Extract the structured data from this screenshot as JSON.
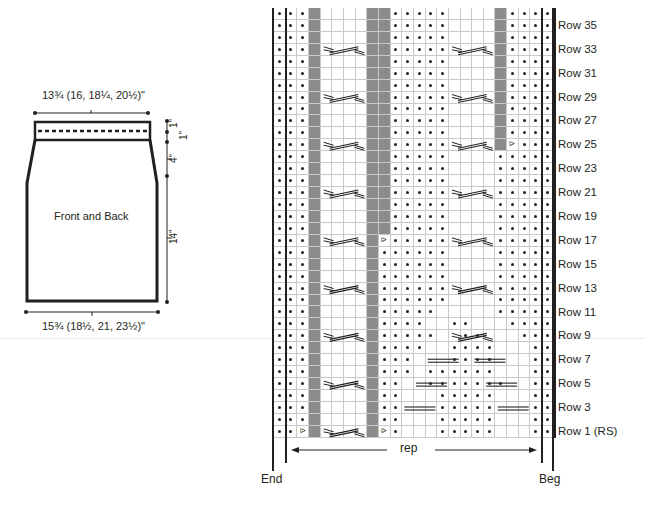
{
  "schematic": {
    "top_width": "13¾ (16, 18¼, 20½)\"",
    "bottom_width": "15¾ (18½, 21, 23½)\"",
    "label": "Front and Back",
    "heights": [
      "1\"",
      "1\"",
      "4\"",
      "14\""
    ]
  },
  "chart": {
    "columns": 24,
    "rows": 36,
    "legend_codes": {
      "p": "purl",
      "k": "knit",
      "g": "no stitch (gray)",
      "d": "decrease"
    },
    "row_labels": [
      {
        "row": 35,
        "label": "Row 35"
      },
      {
        "row": 33,
        "label": "Row 33"
      },
      {
        "row": 31,
        "label": "Row 31"
      },
      {
        "row": 29,
        "label": "Row 29"
      },
      {
        "row": 27,
        "label": "Row 27"
      },
      {
        "row": 25,
        "label": "Row 25"
      },
      {
        "row": 23,
        "label": "Row 23"
      },
      {
        "row": 21,
        "label": "Row 21"
      },
      {
        "row": 19,
        "label": "Row 19"
      },
      {
        "row": 17,
        "label": "Row 17"
      },
      {
        "row": 15,
        "label": "Row 15"
      },
      {
        "row": 13,
        "label": "Row 13"
      },
      {
        "row": 11,
        "label": "Row 11"
      },
      {
        "row": 9,
        "label": "Row 9"
      },
      {
        "row": 7,
        "label": "Row 7"
      },
      {
        "row": 5,
        "label": "Row 5"
      },
      {
        "row": 3,
        "label": "Row 3"
      },
      {
        "row": 1,
        "label": "Row 1 (RS)"
      }
    ],
    "rep_label": "rep",
    "end_label": "End",
    "beg_label": "Beg",
    "grid_rows_top_to_bottom": [
      "pppgkkkkggpppppkkkkgpppp",
      "pppgkkkkggpppppkkkkgpppp",
      "pppgkkkkggpppppkkkkgpppp",
      "pppgkkkkggpppppkkkkgpppp",
      "pppgkkkkggpppppkkkkgpppp",
      "pppgkkkkggpppppkkkkgpppp",
      "pppgkkkkggpppppkkkkgpppp",
      "pppgkkkkggpppppkkkkgpppp",
      "pppgkkkkggpppppkkkkgpppp",
      "pppgkkkkggpppppkkkkgpppp",
      "pppgkkkkggpppppkkkkgpppp",
      "pppgkkkkggpppppkkkkgdppp",
      "pppgkkkkggpppppkkkkppppp",
      "pppgkkkkggpppppkkkkppppp",
      "pppgkkkkggpppppkkkkppppp",
      "pppgkkkkggpppppkkkkppppp",
      "pppgkkkkggpppppkkkkppppp",
      "pppgkkkkggpppppkkkkppppp",
      "pppgkkkkggpppppkkkkppppp",
      "pppgkkkkgdpppppkkkkppppp",
      "pppgkkkkgppppppkkkkppppp",
      "pppgkkkkgppppppkkkkppppp",
      "pppgkkkkgppppppkkkkppppp",
      "pppgkkkkgppppppkkkkppppp",
      "pppgkkkkgppppppkkkkppppp",
      "pppgkkkkgpppppkkkkkppppp",
      "pppgkkkkgppppkkppkkkpppp",
      "pppgkkkkgpppppkkppkkkppp",
      "pppgkkkkgppppkkppppkkkpp",
      "pppgkkkkgpppkkkppppkkkpp",
      "pppgkkkkgpppkppppppkkkpp",
      "pppgkkkkgppkkpppppppkkpp",
      "pppgkkkkgppkkkpppppkkkpp",
      "pppgkkkkgppkkkpppppkkkpp",
      "pppgkkkkgppkkkpppppkkkpp",
      "ppdgkkkkgdpkkkpppppkkkpp"
    ],
    "cable_rows": [
      2,
      4,
      6,
      8,
      10,
      12,
      14,
      16,
      18,
      20,
      22,
      24,
      26,
      28,
      30,
      32,
      34,
      36
    ]
  }
}
